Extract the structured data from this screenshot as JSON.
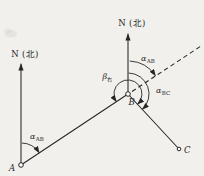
{
  "diagram": {
    "colors": {
      "paper": "#f1f0ed",
      "ink": "#262626"
    },
    "north_label_a": "N (北)",
    "north_label_b": "N (北)",
    "points": {
      "a": "A",
      "b": "B",
      "c": "C"
    },
    "angles": {
      "alpha_ab_a": {
        "base": "α",
        "sub": "AB"
      },
      "alpha_ab_b": {
        "base": "α",
        "sub": "AB"
      },
      "alpha_bc": {
        "base": "α",
        "sub": "BC"
      },
      "beta_right": {
        "base": "β",
        "sub": "右"
      }
    }
  }
}
